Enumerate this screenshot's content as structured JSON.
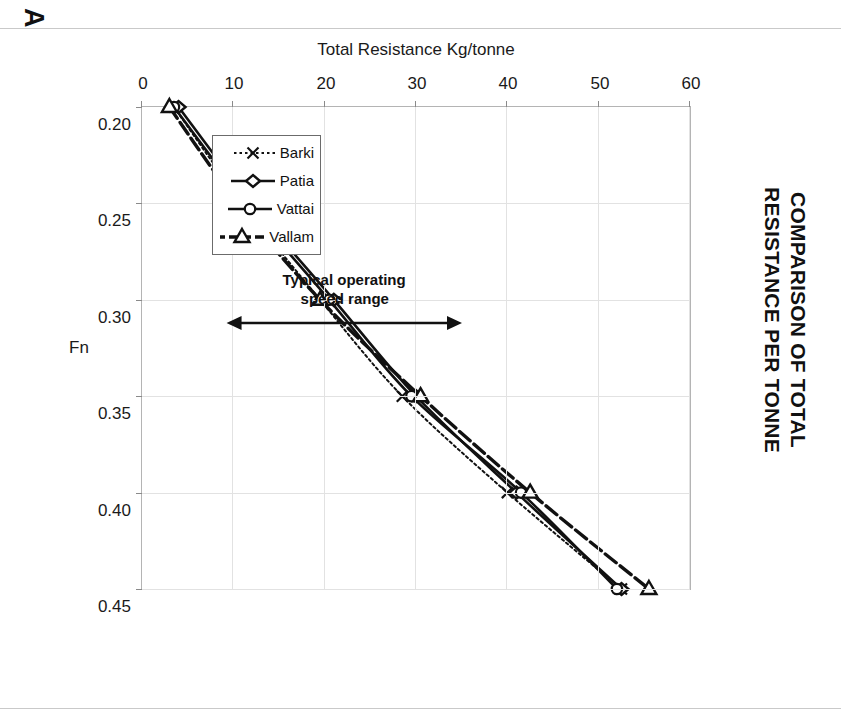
{
  "panel": {
    "letter": "A"
  },
  "title": {
    "line1": "COMPARISON OF TOTAL",
    "line2": "RESISTANCE PER TONNE"
  },
  "axes": {
    "x_title": "Fn",
    "y_title": "Total Resistance Kg/tonne",
    "x_ticks": [
      "0.20",
      "0.25",
      "0.30",
      "0.35",
      "0.40",
      "0.45"
    ],
    "y_ticks": [
      "0",
      "10",
      "20",
      "30",
      "40",
      "50",
      "60"
    ]
  },
  "legend": {
    "items": [
      {
        "label": "Barki",
        "marker": "x-marker",
        "line": "dotted"
      },
      {
        "label": "Patia",
        "marker": "diamond-marker",
        "line": "solid"
      },
      {
        "label": "Vattai",
        "marker": "circle-marker",
        "line": "solid"
      },
      {
        "label": "Vallam",
        "marker": "triangle-marker",
        "line": "dashdot"
      }
    ]
  },
  "annotation": {
    "text": "Typical operating\nspeed range",
    "arrow": "double-headed-arrow",
    "from_fn": 0.25,
    "to_fn": 0.35
  },
  "chart_data": {
    "type": "line",
    "title": "COMPARISON OF TOTAL RESISTANCE PER TONNE",
    "xlabel": "Fn",
    "ylabel": "Total Resistance Kg/tonne",
    "xlim": [
      0.2,
      0.45
    ],
    "ylim": [
      0,
      60
    ],
    "grid": true,
    "legend_position": "inside-lower-left",
    "x": [
      0.2,
      0.25,
      0.3,
      0.35,
      0.4,
      0.45
    ],
    "series": [
      {
        "name": "Barki",
        "marker": "x",
        "linestyle": "dotted",
        "values": [
          3.5,
          11.0,
          19.5,
          28.5,
          40.0,
          52.5
        ]
      },
      {
        "name": "Patia",
        "marker": "diamond",
        "linestyle": "solid",
        "values": [
          4.0,
          12.0,
          21.0,
          30.0,
          41.0,
          52.5
        ]
      },
      {
        "name": "Vattai",
        "marker": "circle",
        "linestyle": "solid",
        "values": [
          3.5,
          11.5,
          20.5,
          29.5,
          41.5,
          52.0
        ]
      },
      {
        "name": "Vallam",
        "marker": "triangle",
        "linestyle": "dashdot",
        "values": [
          3.0,
          10.5,
          19.5,
          30.5,
          42.5,
          55.5
        ]
      }
    ]
  },
  "colors": {
    "ink": "#111111",
    "grid": "#e2e2e2",
    "frame": "#b4b4b4"
  }
}
